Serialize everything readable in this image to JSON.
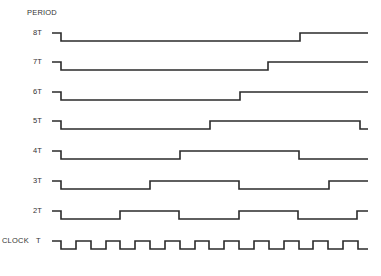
{
  "header": {
    "title": "PERIOD"
  },
  "clock_label": "CLOCK",
  "colors": {
    "line": "#2b2b2b",
    "background": "#ffffff"
  },
  "timing": {
    "x_start": 52,
    "x_first_edge": 61,
    "x_end": 368,
    "half_period_px": 14.85,
    "high_offset": 0,
    "low_offset": 8
  },
  "signals": [
    {
      "label": "8T",
      "y": 33,
      "edges": [
        61,
        300
      ],
      "end_level": "high"
    },
    {
      "label": "7T",
      "y": 62,
      "edges": [
        61,
        268
      ],
      "end_level": "high"
    },
    {
      "label": "6T",
      "y": 92,
      "edges": [
        61,
        240
      ],
      "end_level": "high"
    },
    {
      "label": "5T",
      "y": 121,
      "edges": [
        61,
        210,
        360
      ],
      "end_level": "low"
    },
    {
      "label": "4T",
      "y": 151,
      "edges": [
        61,
        180,
        299
      ],
      "end_level": "low"
    },
    {
      "label": "3T",
      "y": 181,
      "edges": [
        61,
        150,
        239,
        329
      ],
      "end_level": "high"
    },
    {
      "label": "2T",
      "y": 211,
      "edges": [
        61,
        120,
        179,
        239,
        298,
        357
      ],
      "end_level": "high"
    },
    {
      "label": "T",
      "y": 241,
      "clock": true,
      "end_level": "low"
    }
  ]
}
